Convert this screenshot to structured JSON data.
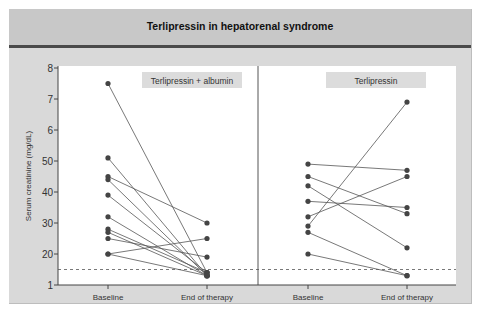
{
  "figure": {
    "title": "Terlipressin in hepatorenal syndrome",
    "ylabel": "Serum creatinine (mg/dL)",
    "y_tick_labels": [
      "8",
      "7",
      "6",
      "50",
      "40",
      "30",
      "20",
      "1"
    ],
    "x_tick_labels": [
      "Baseline",
      "End of therapy"
    ],
    "panels": [
      {
        "label": "Terlipressin + albumin"
      },
      {
        "label": "Terlipressin"
      }
    ]
  },
  "colors": {
    "frame_bg": "#d9d9d9",
    "title_bg": "#c8c8c8",
    "title_rule": "#4a4a4a",
    "plot_bg": "#ffffff",
    "line": "#555555",
    "marker": "#444444",
    "label_box": "#dcdcdc"
  },
  "chart_data": {
    "type": "line",
    "title": "Terlipressin in hepatorenal syndrome",
    "xlabel": "",
    "ylabel": "Serum creatinine (mg/dL)",
    "ylim": [
      1,
      8
    ],
    "y_ticks": [
      1,
      2,
      3,
      4,
      5,
      6,
      7,
      8
    ],
    "y_tick_labels_as_printed": [
      "1",
      "20",
      "30",
      "40",
      "50",
      "6",
      "7",
      "8"
    ],
    "categories": [
      "Baseline",
      "End of therapy"
    ],
    "reference_line": {
      "y": 1.5,
      "style": "dashed"
    },
    "grid": false,
    "panels": [
      {
        "name": "Terlipressin + albumin",
        "series": [
          {
            "name": "patient 1",
            "values": [
              7.5,
              1.4
            ]
          },
          {
            "name": "patient 2",
            "values": [
              5.1,
              1.3
            ]
          },
          {
            "name": "patient 3",
            "values": [
              4.5,
              3.0
            ]
          },
          {
            "name": "patient 4",
            "values": [
              4.4,
              1.3
            ]
          },
          {
            "name": "patient 5",
            "values": [
              3.9,
              1.4
            ]
          },
          {
            "name": "patient 6",
            "values": [
              3.2,
              1.3
            ]
          },
          {
            "name": "patient 7",
            "values": [
              2.8,
              1.4
            ]
          },
          {
            "name": "patient 8",
            "values": [
              2.7,
              1.3
            ]
          },
          {
            "name": "patient 9",
            "values": [
              2.5,
              1.9
            ]
          },
          {
            "name": "patient 10",
            "values": [
              2.0,
              2.5
            ]
          },
          {
            "name": "patient 11",
            "values": [
              2.0,
              1.3
            ]
          }
        ]
      },
      {
        "name": "Terlipressin",
        "series": [
          {
            "name": "patient 1",
            "values": [
              4.9,
              4.7
            ]
          },
          {
            "name": "patient 2",
            "values": [
              4.5,
              3.3
            ]
          },
          {
            "name": "patient 3",
            "values": [
              4.2,
              2.2
            ]
          },
          {
            "name": "patient 4",
            "values": [
              3.7,
              3.5
            ]
          },
          {
            "name": "patient 5",
            "values": [
              3.2,
              4.5
            ]
          },
          {
            "name": "patient 6",
            "values": [
              2.9,
              6.9
            ]
          },
          {
            "name": "patient 7",
            "values": [
              2.7,
              1.3
            ]
          },
          {
            "name": "patient 8",
            "values": [
              2.0,
              1.3
            ]
          }
        ]
      }
    ]
  }
}
